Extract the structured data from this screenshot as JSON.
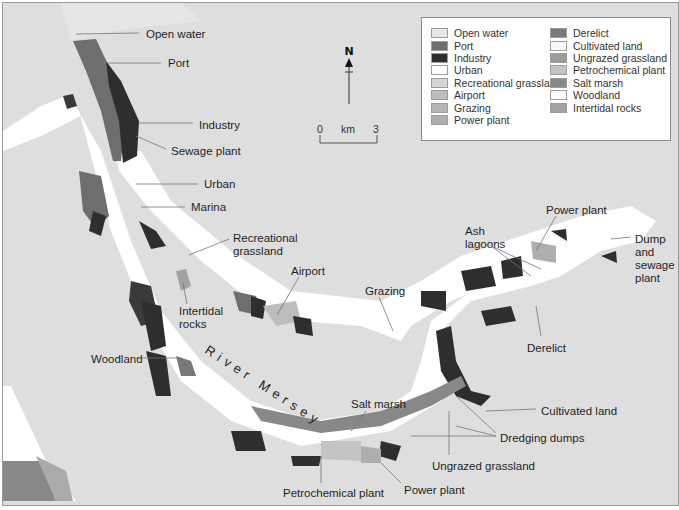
{
  "map": {
    "river_label": "River Mersey",
    "background_color": "#dedede",
    "north_label": "N",
    "scale": {
      "start": "0",
      "unit": "km",
      "end": "3"
    }
  },
  "legend": {
    "items": [
      {
        "label": "Open water",
        "color": "#e8e8e8"
      },
      {
        "label": "Port",
        "color": "#6e6e6e"
      },
      {
        "label": "Industry",
        "color": "#2e2e2e"
      },
      {
        "label": "Urban",
        "color": "#ffffff"
      },
      {
        "label": "Recreational grassland",
        "color": "#d6d6d6"
      },
      {
        "label": "Airport",
        "color": "#bdbdbd"
      },
      {
        "label": "Grazing",
        "color": "#b5b5b5"
      },
      {
        "label": "Power plant",
        "color": "#aeaeae"
      },
      {
        "label": "Derelict",
        "color": "#7a7a7a"
      },
      {
        "label": "Cultivated land",
        "color": "#f8f8f8"
      },
      {
        "label": "Ungrazed grassland",
        "color": "#9c9c9c"
      },
      {
        "label": "Petrochemical plant",
        "color": "#c4c4c4"
      },
      {
        "label": "Salt marsh",
        "color": "#888888"
      },
      {
        "label": "Woodland",
        "color": "#fdfdfd"
      },
      {
        "label": "Intertidal rocks",
        "color": "#a2a2a2"
      }
    ]
  },
  "annotations": [
    {
      "id": "open-water",
      "text": "Open water"
    },
    {
      "id": "port",
      "text": "Port"
    },
    {
      "id": "industry",
      "text": "Industry"
    },
    {
      "id": "sewage-plant",
      "text": "Sewage plant"
    },
    {
      "id": "urban",
      "text": "Urban"
    },
    {
      "id": "marina",
      "text": "Marina"
    },
    {
      "id": "recreational-grassland",
      "text": "Recreational\ngrassland"
    },
    {
      "id": "airport",
      "text": "Airport"
    },
    {
      "id": "intertidal-rocks",
      "text": "Intertidal\nrocks"
    },
    {
      "id": "woodland",
      "text": "Woodland"
    },
    {
      "id": "grazing",
      "text": "Grazing"
    },
    {
      "id": "ash-lagoons",
      "text": "Ash\nlagoons"
    },
    {
      "id": "power-plant-ne",
      "text": "Power plant"
    },
    {
      "id": "dump-sewage",
      "text": "Dump\nand\nsewage\nplant"
    },
    {
      "id": "derelict",
      "text": "Derelict"
    },
    {
      "id": "salt-marsh",
      "text": "Salt marsh"
    },
    {
      "id": "cultivated-land",
      "text": "Cultivated land"
    },
    {
      "id": "dredging-dumps",
      "text": "Dredging dumps"
    },
    {
      "id": "ungrazed-grassland",
      "text": "Ungrazed grassland"
    },
    {
      "id": "petrochemical-plant",
      "text": "Petrochemical plant"
    },
    {
      "id": "power-plant-s",
      "text": "Power plant"
    }
  ]
}
